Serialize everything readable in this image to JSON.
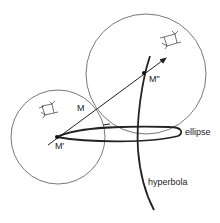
{
  "diagram": {
    "title": "",
    "labels": {
      "M": "M",
      "M_prime": "M'",
      "M_double_prime": "M\"",
      "ellipse": "ellipse",
      "hyperbola": "hyperbola"
    },
    "elements": {
      "left_circle": {
        "cx": 58,
        "cy": 137,
        "r": 47
      },
      "right_circle": {
        "cx": 146,
        "cy": 74,
        "r": 60
      },
      "point_M_prime": {
        "x": 57,
        "y": 137
      },
      "point_M_double_prime": {
        "x": 144,
        "y": 73
      },
      "arrow": {
        "from": [
          48,
          145
        ],
        "to": [
          167,
          57
        ]
      }
    },
    "colors": {
      "stroke": "#222222",
      "thin_stroke": "#555555",
      "background": "#ffffff"
    }
  }
}
